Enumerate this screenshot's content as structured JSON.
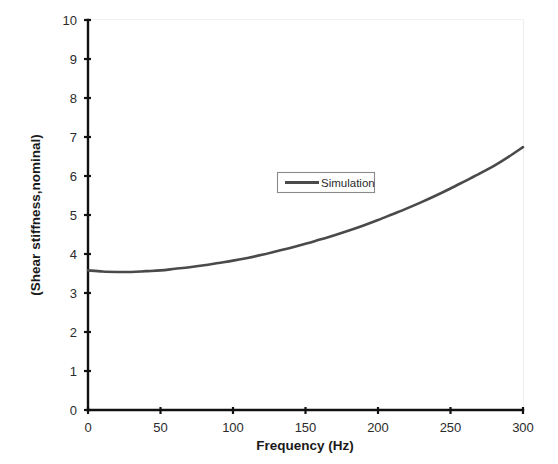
{
  "chart_data": {
    "type": "line",
    "title": "",
    "xlabel": "Frequency (Hz)",
    "ylabel": "(Shear stiffness,nominal)",
    "xlim": [
      0,
      300
    ],
    "ylim": [
      0,
      10
    ],
    "xticks": [
      "0",
      "50",
      "100",
      "150",
      "200",
      "250",
      "300"
    ],
    "xtick_values": [
      0,
      50,
      100,
      150,
      200,
      250,
      300
    ],
    "yticks": [
      "0",
      "1",
      "2",
      "3",
      "4",
      "5",
      "6",
      "7",
      "8",
      "9",
      "10"
    ],
    "ytick_values": [
      0,
      1,
      2,
      3,
      4,
      5,
      6,
      7,
      8,
      9,
      10
    ],
    "grid": false,
    "legend_position": "upper center",
    "legend_entries": [
      "Simulation"
    ],
    "series": [
      {
        "name": "Simulation",
        "color": "#4a4a4a",
        "x": [
          0,
          10,
          20,
          30,
          40,
          50,
          60,
          70,
          80,
          90,
          100,
          110,
          120,
          130,
          140,
          150,
          160,
          170,
          180,
          190,
          200,
          210,
          220,
          230,
          240,
          250,
          260,
          270,
          280,
          290,
          300
        ],
        "values": [
          3.58,
          3.55,
          3.54,
          3.54,
          3.56,
          3.58,
          3.62,
          3.66,
          3.71,
          3.77,
          3.83,
          3.9,
          3.98,
          4.07,
          4.16,
          4.26,
          4.37,
          4.48,
          4.6,
          4.73,
          4.87,
          5.02,
          5.17,
          5.33,
          5.5,
          5.68,
          5.87,
          6.06,
          6.26,
          6.49,
          6.74
        ]
      }
    ]
  },
  "legend": {
    "entry_label": "Simulation"
  },
  "axes": {
    "x_title": "Frequency (Hz)",
    "y_title": "(Shear stiffness,nominal)"
  },
  "colors": {
    "series": "#4a4a4a",
    "axis": "#111111",
    "frame": "#e3e3e3",
    "background": "#ffffff"
  }
}
